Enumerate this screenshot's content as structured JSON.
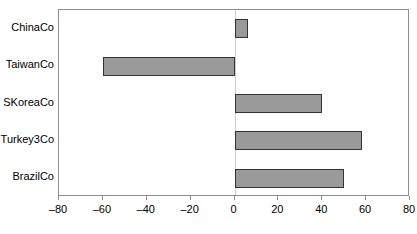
{
  "chart_data": {
    "type": "bar",
    "orientation": "horizontal",
    "title": "",
    "subtitle": "",
    "xlabel": "",
    "ylabel": "",
    "categories": [
      "ChinaCo",
      "TaiwanCo",
      "SKoreaCo",
      "Turkey3Co",
      "BrazilCo"
    ],
    "values": [
      6,
      -60,
      40,
      58,
      50
    ],
    "xlim": [
      -80,
      80
    ],
    "xticks": [
      -80,
      -60,
      -40,
      -20,
      0,
      20,
      40,
      60,
      80
    ],
    "xtick_labels": [
      "–80",
      "–60",
      "–40",
      "–20",
      "0",
      "20",
      "40",
      "60",
      "80"
    ],
    "grid": false,
    "zero_line": true,
    "legend": null,
    "legend_position": "none",
    "annotations": []
  },
  "style": {
    "bar_fill": "#9a9a9a",
    "bar_border": "#333333",
    "frame_border": "#8d8d8d",
    "zero_line_color": "#cfcfcf",
    "text_color": "#000000",
    "background": "#ffffff"
  }
}
